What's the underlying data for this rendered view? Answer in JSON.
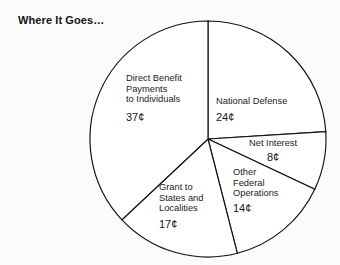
{
  "chart_data": {
    "type": "pie",
    "title": "Where It Goes…",
    "unit": "¢",
    "total": 100,
    "start_angle_deg": 0,
    "direction": "clockwise",
    "center": [
      208,
      139
    ],
    "radius": 118,
    "legend": "none",
    "grid": false,
    "categories": [
      "National Defense",
      "Net Interest",
      "Other Federal Operations",
      "Grant to States and Localities",
      "Direct Benefit Payments to Individuals"
    ],
    "values": [
      24,
      8,
      14,
      17,
      37
    ],
    "slices": [
      {
        "name": "National Defense",
        "label_lines": [
          "National Defense"
        ],
        "value": 24,
        "value_label": "24¢"
      },
      {
        "name": "Net Interest",
        "label_lines": [
          "Net Interest"
        ],
        "value": 8,
        "value_label": "8¢"
      },
      {
        "name": "Other Federal Operations",
        "label_lines": [
          "Other",
          "Federal",
          "Operations"
        ],
        "value": 14,
        "value_label": "14¢"
      },
      {
        "name": "Grant to States and Localities",
        "label_lines": [
          "Grant to",
          "States and",
          "Localities"
        ],
        "value": 17,
        "value_label": "17¢"
      },
      {
        "name": "Direct Benefit Payments to Individuals",
        "label_lines": [
          "Direct Benefit",
          "Payments",
          "to Individuals"
        ],
        "value": 37,
        "value_label": "37¢"
      }
    ],
    "colors": {
      "slice_fill": "#ffffff",
      "slice_stroke": "#101010",
      "background": "#fbfbfb",
      "text": "#1b1b1b",
      "title_text": "#141414"
    }
  }
}
